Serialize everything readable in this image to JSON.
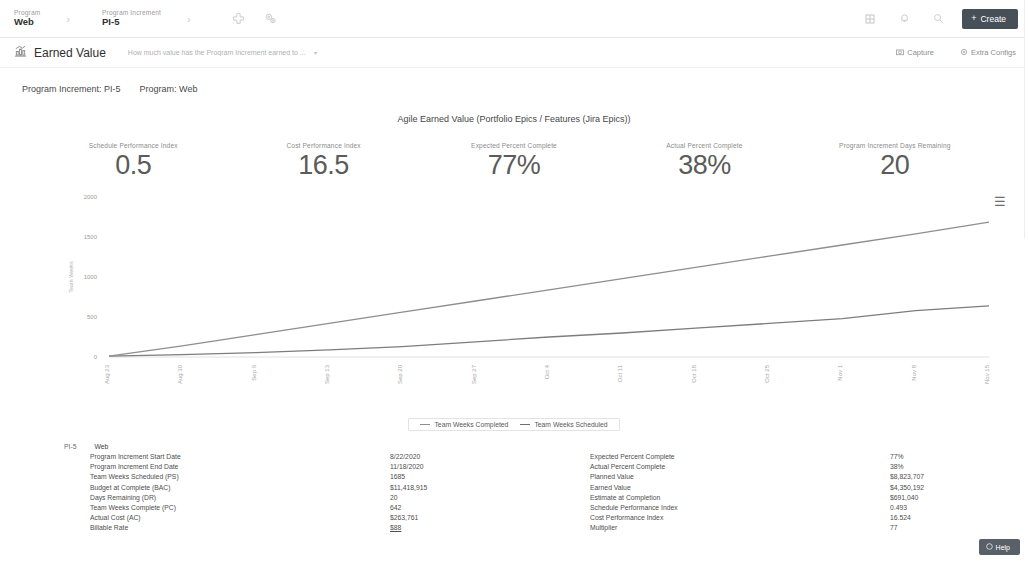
{
  "topbar": {
    "breadcrumbs": [
      {
        "caption": "Program",
        "value": "Web"
      },
      {
        "caption": "Program Increment",
        "value": "PI-5"
      }
    ],
    "separator": "›",
    "add_icon": "add-circle-icon",
    "settings_icon": "gears-icon",
    "right_icons": [
      "grid-icon",
      "bell-icon",
      "search-icon"
    ],
    "create_label": "Create",
    "create_icon": "plus-icon"
  },
  "page_header": {
    "icon": "chart-report-icon",
    "title": "Earned Value",
    "subtitle": "How much value has the Program Increment earned to ...",
    "subtitle_caret": "▾",
    "capture_label": "Capture",
    "capture_icon": "camera-icon",
    "extra_configs_label": "Extra Configs",
    "extra_configs_icon": "settings-icon"
  },
  "context": {
    "program_increment_label": "Program Increment: PI-5",
    "program_label": "Program: Web"
  },
  "kpis": [
    {
      "label": "Schedule Performance Index",
      "value": "0.5"
    },
    {
      "label": "Cost Performance Index",
      "value": "16.5"
    },
    {
      "label": "Expected Percent Complete",
      "value": "77%"
    },
    {
      "label": "Actual Percent Complete",
      "value": "38%"
    },
    {
      "label": "Program Increment Days Remaining",
      "value": "20"
    }
  ],
  "chart_menu_icon": "hamburger-menu-icon",
  "chart_data": {
    "type": "line",
    "title": "Agile Earned Value (Portfolio Epics / Features (Jira Epics))",
    "xlabel": "",
    "ylabel": "Team Weeks",
    "ylim": [
      0,
      2000
    ],
    "yticks": [
      0,
      500,
      1000,
      1500,
      2000
    ],
    "grid": false,
    "legend_position": "bottom",
    "x": [
      "Aug 23",
      "Aug 30",
      "Sep 6",
      "Sep 13",
      "Sep 20",
      "Sep 27",
      "Oct 4",
      "Oct 11",
      "Oct 18",
      "Oct 25",
      "Nov 1",
      "Nov 8",
      "Nov 15"
    ],
    "series": [
      {
        "name": "Team Weeks Completed",
        "color": "#7d7d7d",
        "values": [
          10,
          30,
          55,
          90,
          130,
          190,
          250,
          300,
          360,
          420,
          480,
          580,
          640
        ]
      },
      {
        "name": "Team Weeks Scheduled",
        "color": "#8e8e8e",
        "values": [
          10,
          140,
          280,
          420,
          560,
          700,
          840,
          980,
          1120,
          1260,
          1400,
          1540,
          1685
        ]
      }
    ]
  },
  "data_table": {
    "program_increment": "PI-5",
    "program": "Web",
    "left": {
      "labels": [
        "Program Increment Start Date",
        "Program Increment End Date",
        "Team Weeks Scheduled (PS)",
        "Budget at Complete (BAC)",
        "Days Remaining (DR)",
        "Team Weeks Complete (PC)",
        "Actual Cost (AC)",
        "Billable Rate"
      ],
      "values": [
        "8/22/2020",
        "11/18/2020",
        "1685",
        "$11,418,915",
        "20",
        "642",
        "$263,761",
        "$88"
      ]
    },
    "right": {
      "labels": [
        "Expected Percent Complete",
        "Actual Percent Complete",
        "Planned Value",
        "Earned Value",
        "Estimate at Completion",
        "Schedule Performance Index",
        "Cost Performance Index",
        "Multiplier"
      ],
      "values": [
        "77%",
        "38%",
        "$8,823,707",
        "$4,350,192",
        "$691,040",
        "0.493",
        "16.524",
        "77"
      ]
    }
  },
  "help": {
    "label": "Help",
    "icon": "help-icon"
  }
}
